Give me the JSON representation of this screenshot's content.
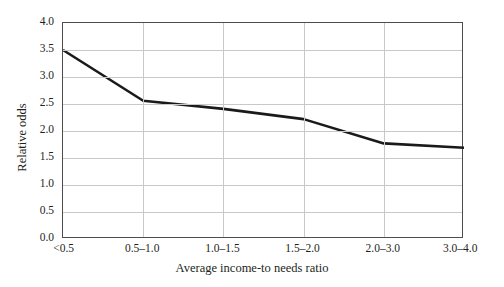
{
  "chart_data": {
    "type": "line",
    "title": "",
    "subtitle": "",
    "xlabel": "Average income-to needs ratio",
    "ylabel": "Relative odds",
    "categories": [
      "<0.5",
      "0.5–1.0",
      "1.0–1.5",
      "1.5–2.0",
      "2.0–3.0",
      "3.0–4.0"
    ],
    "values": [
      3.5,
      2.56,
      2.41,
      2.22,
      1.77,
      1.69
    ],
    "series": [
      {
        "name": "Relative odds",
        "values": [
          3.5,
          2.56,
          2.41,
          2.22,
          1.77,
          1.69
        ]
      }
    ],
    "ylim": [
      0.0,
      4.0
    ],
    "yticks": [
      0.0,
      0.5,
      1.0,
      1.5,
      2.0,
      2.5,
      3.0,
      3.5,
      4.0
    ],
    "ytick_labels": [
      "0.0",
      "0.5",
      "1.0",
      "1.5",
      "2.0",
      "2.5",
      "3.0",
      "3.5",
      "4.0"
    ],
    "grid": {
      "horizontal": true,
      "vertical": true,
      "color": "#c8c8c8"
    },
    "legend": {
      "visible": false,
      "position": "none",
      "entries": []
    },
    "annotations": [],
    "style": {
      "line_color": "#1a1a1a",
      "line_width": 2.6,
      "frame_color": "#4d4d4d",
      "background": "#ffffff",
      "markers": "none"
    }
  }
}
